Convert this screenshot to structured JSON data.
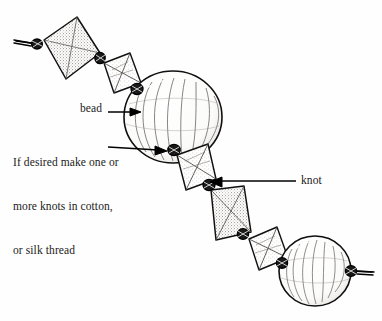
{
  "figure": {
    "title": "Rethreading a necklace",
    "caption": "Rethreading a necklace",
    "labels": {
      "bead": "bead",
      "knot": "knot",
      "note_line1": "If desired make one or",
      "note_line2": "more knots in cotton,",
      "note_line3": "or silk thread"
    },
    "colors": {
      "ink": "#000000",
      "background": "#ffffff",
      "stipple_fill": "#b9b5ae",
      "bead_fill": "#ffffff",
      "text": "#1a1a1a"
    },
    "components": {
      "diamond_beads": 5,
      "round_beads": 2,
      "knots": 7,
      "thread_ends": 2
    },
    "style": "pen-and-ink line drawing"
  }
}
